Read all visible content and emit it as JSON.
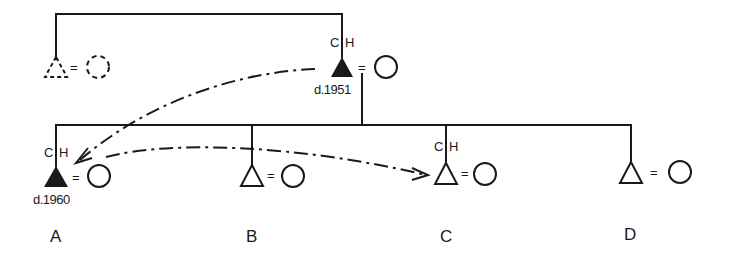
{
  "diagram": {
    "type": "kinship-genealogy",
    "colors": {
      "ink": "#1a1a1a",
      "background": "#ffffff"
    },
    "generation1": {
      "absent_member": {
        "symbol": "dashed-triangle",
        "spouse": "dashed-circle",
        "marriage": "="
      },
      "father": {
        "symbol": "filled-triangle",
        "spouse": "circle",
        "marriage": "=",
        "roles": [
          "C",
          "H"
        ],
        "death": "d.1951"
      }
    },
    "siblings": [
      {
        "label": "A",
        "symbol": "filled-triangle",
        "roles": [
          "C",
          "H"
        ],
        "death": "d.1960",
        "marriage": "="
      },
      {
        "label": "B",
        "symbol": "triangle",
        "roles": [],
        "death": "",
        "marriage": "="
      },
      {
        "label": "C",
        "symbol": "triangle",
        "roles": [
          "C",
          "H"
        ],
        "death": "",
        "marriage": "="
      },
      {
        "label": "D",
        "symbol": "triangle",
        "roles": [],
        "death": "",
        "marriage": "="
      }
    ],
    "transfers": [
      {
        "from": "father (d.1951)",
        "to": "A",
        "style": "dash-dot arrow"
      },
      {
        "from": "A",
        "to": "C",
        "style": "dash-dot arrow"
      }
    ]
  }
}
